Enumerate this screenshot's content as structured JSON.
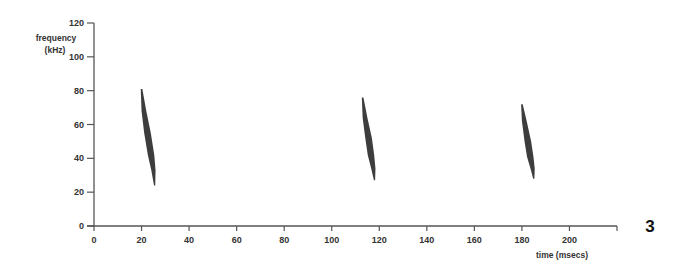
{
  "figure": {
    "panel_label": "3",
    "colors": {
      "axis": "#555555",
      "text": "#333333",
      "call_ink": "#222222",
      "background": "#ffffff"
    }
  },
  "chart_data": {
    "type": "scatter",
    "subtype": "spectrogram",
    "title": "",
    "xlabel": "time (msecs)",
    "ylabel": "frequency (kHz)",
    "ylabel_lines": [
      "frequency",
      "(kHz)"
    ],
    "xlim": [
      0,
      220
    ],
    "ylim": [
      0,
      120
    ],
    "xticks": [
      0,
      20,
      40,
      60,
      80,
      100,
      120,
      140,
      160,
      180,
      200
    ],
    "yticks": [
      0,
      20,
      40,
      60,
      80,
      100,
      120
    ],
    "grid": false,
    "legend": null,
    "series": [
      {
        "name": "call 1",
        "start": {
          "time_ms": 20,
          "freq_khz": 81
        },
        "end": {
          "time_ms": 25.5,
          "freq_khz": 24
        },
        "points": [
          [
            20,
            81
          ],
          [
            21,
            68
          ],
          [
            22.5,
            55
          ],
          [
            24,
            42
          ],
          [
            25,
            33
          ],
          [
            25.5,
            24
          ]
        ]
      },
      {
        "name": "call 2",
        "start": {
          "time_ms": 113,
          "freq_khz": 76
        },
        "end": {
          "time_ms": 118,
          "freq_khz": 27
        },
        "points": [
          [
            113,
            76
          ],
          [
            114,
            64
          ],
          [
            115.5,
            52
          ],
          [
            116.5,
            42
          ],
          [
            117.5,
            34
          ],
          [
            118,
            27
          ]
        ]
      },
      {
        "name": "call 3",
        "start": {
          "time_ms": 180,
          "freq_khz": 72
        },
        "end": {
          "time_ms": 185,
          "freq_khz": 28
        },
        "points": [
          [
            180,
            72
          ],
          [
            181,
            62
          ],
          [
            182.5,
            50
          ],
          [
            183.5,
            41
          ],
          [
            184.5,
            34
          ],
          [
            185,
            28
          ]
        ]
      }
    ],
    "annotations": [
      {
        "text": "3",
        "position": "right of plot, level with x-axis"
      }
    ]
  }
}
